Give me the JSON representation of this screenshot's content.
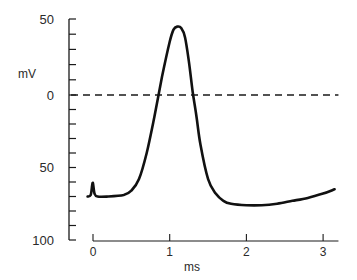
{
  "chart_data": {
    "type": "line",
    "title": "",
    "xlabel": "ms",
    "ylabel": "mV",
    "xlim": [
      -0.2,
      3.2
    ],
    "ylim": [
      -100,
      50
    ],
    "x_ticks": [
      0,
      1,
      2,
      3
    ],
    "x_tick_labels": [
      "0",
      "1",
      "2",
      "3"
    ],
    "y_major_ticks": [
      50,
      0,
      -50,
      -100
    ],
    "y_tick_labels": [
      "50",
      "0",
      "50",
      "100"
    ],
    "y_minor_tick_step": 10,
    "grid": false,
    "legend": null,
    "reference_lines": [
      {
        "name": "zero-potential",
        "y": 0,
        "style": "dashed",
        "x_from": 0.0,
        "x_to": 3.2
      }
    ],
    "series": [
      {
        "name": "action potential",
        "x": [
          -0.07,
          -0.03,
          -0.01,
          0.0,
          0.02,
          0.06,
          0.2,
          0.4,
          0.5,
          0.6,
          0.7,
          0.8,
          0.9,
          1.0,
          1.05,
          1.1,
          1.15,
          1.2,
          1.25,
          1.3,
          1.35,
          1.4,
          1.5,
          1.6,
          1.7,
          1.8,
          2.0,
          2.2,
          2.4,
          2.6,
          2.8,
          3.0,
          3.15
        ],
        "values": [
          -70,
          -69,
          -62,
          -61,
          -68,
          -70,
          -70,
          -69,
          -66,
          -58,
          -40,
          -15,
          12,
          35,
          43,
          45,
          44,
          38,
          22,
          2,
          -15,
          -34,
          -58,
          -68,
          -73,
          -75,
          -76,
          -76,
          -75,
          -73,
          -71,
          -68,
          -65
        ]
      }
    ],
    "annotations": [
      "stimulus artifact near 0 ms"
    ]
  }
}
